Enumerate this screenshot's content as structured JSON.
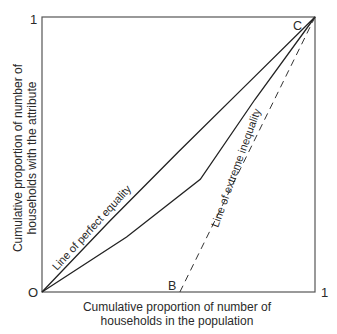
{
  "chart_data": {
    "type": "line",
    "title": "",
    "xlabel": [
      "Cumulative proportion of number of",
      "households in the population"
    ],
    "ylabel": [
      "Cumulative proportion of number of",
      "households with the attribute"
    ],
    "xlim": [
      0,
      1
    ],
    "ylim": [
      0,
      1
    ],
    "grid": false,
    "legend": "none",
    "tick_labels": {
      "origin": "O",
      "x_max": "1",
      "y_max": "1"
    },
    "point_labels": {
      "B": "B",
      "C": "C"
    },
    "points": {
      "O": [
        0,
        0
      ],
      "B": [
        0.505,
        0
      ],
      "C": [
        1,
        1
      ]
    },
    "series": [
      {
        "name": "Line of perfect equality",
        "style": "solid",
        "annotation": "Line of perfect equality",
        "x": [
          0,
          0.25,
          0.5,
          0.75,
          1
        ],
        "y": [
          0,
          0.26,
          0.51,
          0.755,
          1
        ]
      },
      {
        "name": "Lorenz curve",
        "style": "solid",
        "annotation": "",
        "x": [
          0,
          0.31,
          0.58,
          0.78,
          1
        ],
        "y": [
          0,
          0.2,
          0.41,
          0.7,
          1
        ]
      },
      {
        "name": "Line of extreme inequality",
        "style": "dashed",
        "annotation": "Line of extreme inequality",
        "x": [
          0.505,
          1
        ],
        "y": [
          0,
          1
        ]
      }
    ]
  }
}
